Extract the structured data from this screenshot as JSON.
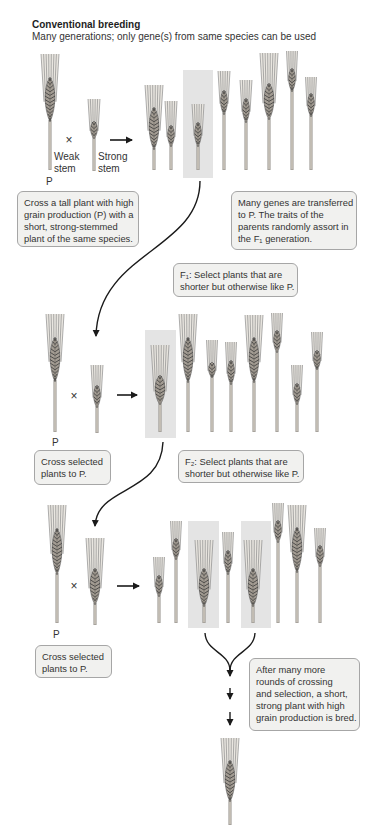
{
  "header": {
    "title": "Conventional breeding",
    "subtitle": "Many generations; only gene(s) from same species can be used"
  },
  "labels": {
    "parent": "P",
    "cross": "×",
    "weak_stem": [
      "Weak",
      "stem"
    ],
    "strong_stem": [
      "Strong",
      "stem"
    ]
  },
  "boxes": [
    {
      "id": "cross-initial",
      "lines": [
        "Cross a tall plant with high",
        "grain production (P) with a",
        "short, strong-stemmed",
        "plant of the same species."
      ]
    },
    {
      "id": "genes-transferred",
      "lines": [
        "Many genes are transferred",
        "to P. The traits of the",
        "parents randomly assort in",
        "the F₁ generation."
      ]
    },
    {
      "id": "f1-select",
      "lines": [
        "F₁: Select plants that are",
        "shorter but otherwise like P."
      ]
    },
    {
      "id": "cross-selected-1",
      "lines": [
        "Cross selected",
        "plants to P."
      ]
    },
    {
      "id": "f2-select",
      "lines": [
        "F₂: Select plants that are",
        "shorter but otherwise like P."
      ]
    },
    {
      "id": "cross-selected-2",
      "lines": [
        "Cross selected",
        "plants to P."
      ]
    },
    {
      "id": "result",
      "lines": [
        "After many more",
        "rounds of crossing",
        "and selection, a short,",
        "strong plant with high",
        "grain production is bred."
      ]
    }
  ],
  "diagram": {
    "colors": {
      "box_bg": "#f1f1ef",
      "box_border": "#a6a6a6",
      "highlight": "#e4e4e4",
      "arrow": "#1a1a1a",
      "awn": "#8c8c8c",
      "ear": "#a39c93",
      "ear_pattern": "#3a3a3a",
      "stem": "#8e8a84",
      "stem_inner": "#d8d2c8"
    },
    "highlights": [
      {
        "name": "f1-selected-highlight",
        "x": 183,
        "y": 70,
        "w": 30,
        "h": 108
      },
      {
        "name": "f2-selected-highlight",
        "x": 145,
        "y": 330,
        "w": 31,
        "h": 108
      },
      {
        "name": "f3-selected-highlight-1",
        "x": 188,
        "y": 521,
        "w": 31,
        "h": 107
      },
      {
        "name": "f3-selected-highlight-2",
        "x": 241,
        "y": 521,
        "w": 30,
        "h": 107
      }
    ],
    "plants": [
      {
        "row": 1,
        "role": "parent-tall-weak-stem",
        "x": 50,
        "awn_top": 54,
        "ear_top": 77,
        "ear_bottom": 122,
        "base": 170,
        "w": 18,
        "ew": 12
      },
      {
        "row": 1,
        "role": "parent-short-strong-stem",
        "x": 94,
        "awn_top": 99,
        "ear_top": 121,
        "ear_bottom": 139,
        "base": 171,
        "w": 12,
        "ew": 8
      },
      {
        "row": 1,
        "role": "f1-offspring",
        "x": 154,
        "awn_top": 85,
        "ear_top": 107,
        "ear_bottom": 150,
        "base": 170,
        "w": 18,
        "ew": 12
      },
      {
        "row": 1,
        "role": "f1-offspring",
        "x": 171,
        "awn_top": 101,
        "ear_top": 125,
        "ear_bottom": 147,
        "base": 170,
        "w": 12,
        "ew": 8
      },
      {
        "row": 1,
        "role": "f1-offspring-selected",
        "x": 198,
        "awn_top": 104,
        "ear_top": 122,
        "ear_bottom": 147,
        "base": 170,
        "w": 12,
        "ew": 8
      },
      {
        "row": 1,
        "role": "f1-offspring",
        "x": 224,
        "awn_top": 71,
        "ear_top": 90,
        "ear_bottom": 115,
        "base": 170,
        "w": 12,
        "ew": 8
      },
      {
        "row": 1,
        "role": "f1-offspring",
        "x": 246,
        "awn_top": 80,
        "ear_top": 98,
        "ear_bottom": 123,
        "base": 170,
        "w": 12,
        "ew": 8
      },
      {
        "row": 1,
        "role": "f1-offspring",
        "x": 269,
        "awn_top": 53,
        "ear_top": 83,
        "ear_bottom": 120,
        "base": 170,
        "w": 18,
        "ew": 12
      },
      {
        "row": 1,
        "role": "f1-offspring",
        "x": 292,
        "awn_top": 51,
        "ear_top": 68,
        "ear_bottom": 92,
        "base": 170,
        "w": 11,
        "ew": 8
      },
      {
        "row": 1,
        "role": "f1-offspring",
        "x": 311,
        "awn_top": 77,
        "ear_top": 93,
        "ear_bottom": 117,
        "base": 170,
        "w": 11,
        "ew": 8
      },
      {
        "row": 2,
        "role": "parent",
        "x": 55,
        "awn_top": 314,
        "ear_top": 337,
        "ear_bottom": 382,
        "base": 432,
        "w": 18,
        "ew": 12
      },
      {
        "row": 2,
        "role": "selected-f1",
        "x": 97,
        "awn_top": 365,
        "ear_top": 385,
        "ear_bottom": 408,
        "base": 433,
        "w": 12,
        "ew": 8
      },
      {
        "row": 2,
        "role": "f2-offspring-selected",
        "x": 160,
        "awn_top": 345,
        "ear_top": 375,
        "ear_bottom": 405,
        "base": 432,
        "w": 18,
        "ew": 12
      },
      {
        "row": 2,
        "role": "f2-offspring",
        "x": 188,
        "awn_top": 314,
        "ear_top": 337,
        "ear_bottom": 383,
        "base": 432,
        "w": 18,
        "ew": 12
      },
      {
        "row": 2,
        "role": "f2-offspring",
        "x": 212,
        "awn_top": 340,
        "ear_top": 362,
        "ear_bottom": 378,
        "base": 432,
        "w": 11,
        "ew": 8
      },
      {
        "row": 2,
        "role": "f2-offspring",
        "x": 231,
        "awn_top": 342,
        "ear_top": 360,
        "ear_bottom": 385,
        "base": 432,
        "w": 11,
        "ew": 8
      },
      {
        "row": 2,
        "role": "f2-offspring",
        "x": 254,
        "awn_top": 315,
        "ear_top": 337,
        "ear_bottom": 383,
        "base": 432,
        "w": 18,
        "ew": 12
      },
      {
        "row": 2,
        "role": "f2-offspring",
        "x": 277,
        "awn_top": 313,
        "ear_top": 330,
        "ear_bottom": 353,
        "base": 432,
        "w": 11,
        "ew": 8
      },
      {
        "row": 2,
        "role": "f2-offspring",
        "x": 297,
        "awn_top": 365,
        "ear_top": 383,
        "ear_bottom": 405,
        "base": 432,
        "w": 11,
        "ew": 8
      },
      {
        "row": 2,
        "role": "f2-offspring",
        "x": 317,
        "awn_top": 332,
        "ear_top": 350,
        "ear_bottom": 370,
        "base": 432,
        "w": 11,
        "ew": 8
      },
      {
        "row": 3,
        "role": "parent",
        "x": 57,
        "awn_top": 505,
        "ear_top": 528,
        "ear_bottom": 575,
        "base": 623,
        "w": 18,
        "ew": 12
      },
      {
        "row": 3,
        "role": "selected-f2",
        "x": 95,
        "awn_top": 538,
        "ear_top": 568,
        "ear_bottom": 605,
        "base": 625,
        "w": 18,
        "ew": 12
      },
      {
        "row": 3,
        "role": "offspring",
        "x": 159,
        "awn_top": 557,
        "ear_top": 575,
        "ear_bottom": 597,
        "base": 623,
        "w": 11,
        "ew": 8
      },
      {
        "row": 3,
        "role": "offspring",
        "x": 176,
        "awn_top": 521,
        "ear_top": 538,
        "ear_bottom": 560,
        "base": 623,
        "w": 11,
        "ew": 8
      },
      {
        "row": 3,
        "role": "offspring-selected",
        "x": 204,
        "awn_top": 540,
        "ear_top": 568,
        "ear_bottom": 607,
        "base": 623,
        "w": 18,
        "ew": 12
      },
      {
        "row": 3,
        "role": "offspring",
        "x": 228,
        "awn_top": 532,
        "ear_top": 550,
        "ear_bottom": 575,
        "base": 623,
        "w": 11,
        "ew": 8
      },
      {
        "row": 3,
        "role": "offspring-selected",
        "x": 253,
        "awn_top": 540,
        "ear_top": 568,
        "ear_bottom": 607,
        "base": 623,
        "w": 18,
        "ew": 12
      },
      {
        "row": 3,
        "role": "offspring",
        "x": 278,
        "awn_top": 503,
        "ear_top": 520,
        "ear_bottom": 543,
        "base": 623,
        "w": 11,
        "ew": 8
      },
      {
        "row": 3,
        "role": "offspring",
        "x": 297,
        "awn_top": 505,
        "ear_top": 527,
        "ear_bottom": 573,
        "base": 623,
        "w": 18,
        "ew": 12
      },
      {
        "row": 3,
        "role": "offspring",
        "x": 320,
        "awn_top": 528,
        "ear_top": 545,
        "ear_bottom": 567,
        "base": 623,
        "w": 11,
        "ew": 8
      },
      {
        "row": 4,
        "role": "final-bred-plant",
        "x": 230,
        "awn_top": 738,
        "ear_top": 760,
        "ear_bottom": 802,
        "base": 825,
        "w": 18,
        "ew": 12
      }
    ]
  }
}
